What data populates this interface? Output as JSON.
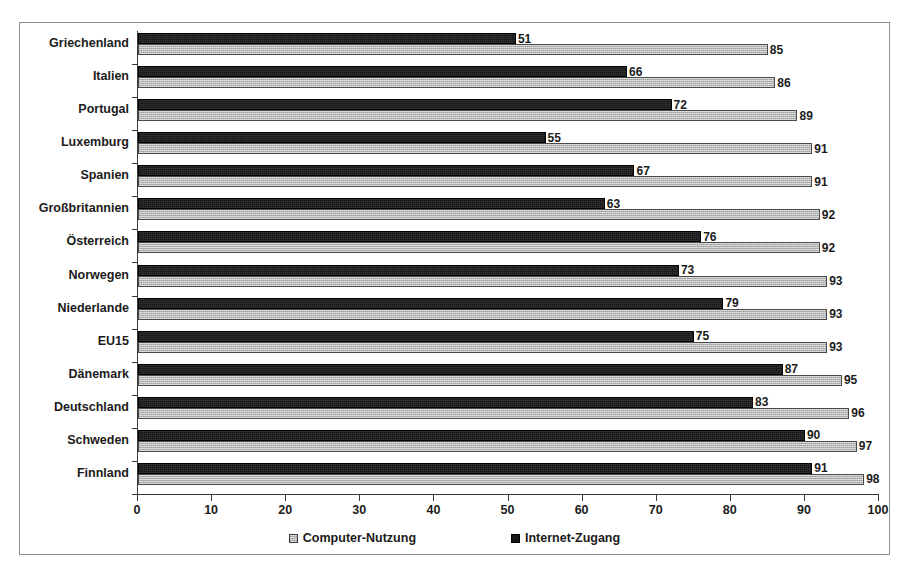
{
  "chart_data": {
    "type": "bar",
    "orientation": "horizontal",
    "title": "",
    "subtitle": "",
    "xlabel": "",
    "ylabel": "",
    "xlim": [
      0,
      100
    ],
    "xticks": [
      0,
      10,
      20,
      30,
      40,
      50,
      60,
      70,
      80,
      90,
      100
    ],
    "xtick_labels": [
      "0",
      "10",
      "20",
      "30",
      "40",
      "50",
      "60",
      "70",
      "80",
      "90",
      "100"
    ],
    "grid": false,
    "legend_position": "bottom-center",
    "categories": [
      "Griechenland",
      "Italien",
      "Portugal",
      "Luxemburg",
      "Spanien",
      "Großbritannien",
      "Österreich",
      "Norwegen",
      "Niederlande",
      "EU15",
      "Dänemark",
      "Deutschland",
      "Schweden",
      "Finnland"
    ],
    "series": [
      {
        "name": "Computer-Nutzung",
        "color": "#b5b5b5",
        "values": [
          85,
          86,
          89,
          91,
          91,
          92,
          92,
          93,
          93,
          93,
          95,
          96,
          97,
          98
        ]
      },
      {
        "name": "Internet-Zugang",
        "color": "#161616",
        "values": [
          51,
          66,
          72,
          55,
          67,
          63,
          76,
          73,
          79,
          75,
          87,
          83,
          90,
          91
        ]
      }
    ]
  },
  "legend": {
    "items": [
      {
        "label": "Computer-Nutzung",
        "swatch": "computer"
      },
      {
        "label": "Internet-Zugang",
        "swatch": "internet"
      }
    ]
  }
}
